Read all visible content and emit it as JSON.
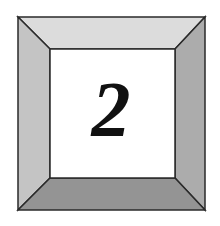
{
  "tile": {
    "label": "2",
    "colors": {
      "background": "#ffffff",
      "top_bevel": "#dcdcdc",
      "left_bevel": "#c4c4c4",
      "right_bevel": "#acacac",
      "bottom_bevel": "#949494",
      "center_face": "#ffffff",
      "outline": "#2a2a2a",
      "digit": "#111111"
    }
  }
}
